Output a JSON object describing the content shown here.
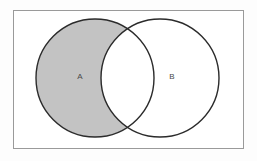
{
  "figure": {
    "type": "venn-diagram",
    "title": "",
    "canvas": {
      "width": 257,
      "height": 161
    },
    "background_color": "#fdfdfd"
  },
  "frame": {
    "name": "diagram-border",
    "x": 13,
    "y": 10,
    "width": 230,
    "height": 138,
    "stroke_color": "#9a9a9a",
    "stroke_width": 1,
    "fill_color": "#ffffff"
  },
  "sets": [
    {
      "id": "A",
      "label": "A",
      "cx": 95,
      "cy": 78,
      "r": 59,
      "fill_color": "#c3c3c3",
      "stroke_color": "#2b2b2b",
      "stroke_width": 1.4,
      "shaded": true,
      "label_x": 80,
      "label_y": 77
    },
    {
      "id": "B",
      "label": "B",
      "cx": 160,
      "cy": 78,
      "r": 59,
      "fill_color": "#ffffff",
      "stroke_color": "#2b2b2b",
      "stroke_width": 1.4,
      "shaded": false,
      "label_x": 172,
      "label_y": 77
    }
  ],
  "intersection": {
    "name": "intersection-region",
    "label": "",
    "fill_color": "#ffffff",
    "shaded": false,
    "top_point": {
      "x": 127,
      "y": 34
    },
    "bottom_point": {
      "x": 127,
      "y": 122
    }
  },
  "label_style": {
    "font_size": 8,
    "color": "#4a4a4a"
  },
  "shading_legend": {
    "shaded_meaning": "A only (A minus B)",
    "shaded_color": "#c3c3c3"
  }
}
